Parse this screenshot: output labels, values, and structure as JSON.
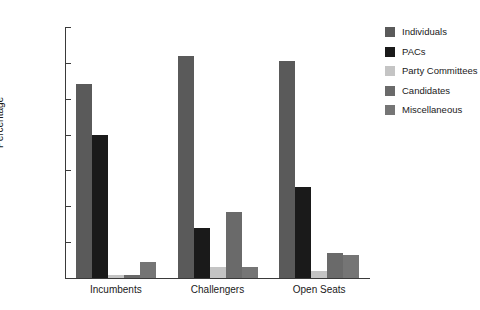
{
  "chart_data": {
    "type": "bar",
    "title": "",
    "xlabel": "",
    "ylabel": "Percentage",
    "ylim": [
      0,
      70
    ],
    "yticks": [
      0,
      10,
      20,
      30,
      40,
      50,
      60,
      70
    ],
    "grid": false,
    "legend_position": "right",
    "categories": [
      "Incumbents",
      "Challengers",
      "Open Seats"
    ],
    "series": [
      {
        "name": "Individuals",
        "color": "#5a5a5a",
        "values": [
          54.0,
          62.0,
          60.5
        ]
      },
      {
        "name": "PACs",
        "color": "#1a1a1a",
        "values": [
          40.0,
          14.0,
          25.5
        ]
      },
      {
        "name": "Party Committees",
        "color": "#c4c4c4",
        "values": [
          0.8,
          3.0,
          2.0
        ]
      },
      {
        "name": "Candidates",
        "color": "#6a6a6a",
        "values": [
          0.9,
          18.5,
          7.0
        ]
      },
      {
        "name": "Miscellaneous",
        "color": "#757575",
        "values": [
          4.5,
          3.0,
          6.5
        ]
      }
    ]
  }
}
